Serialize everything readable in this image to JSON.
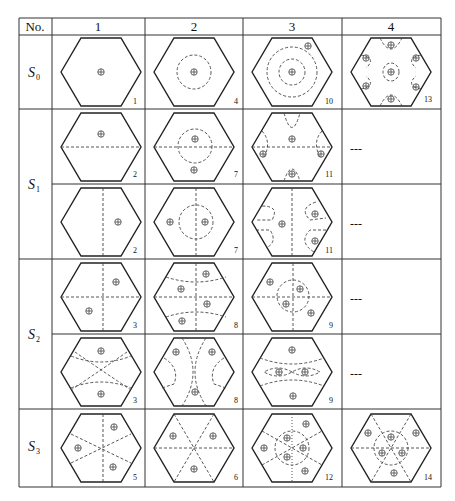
{
  "table": {
    "header": [
      "No.",
      "1",
      "2",
      "3",
      "4"
    ],
    "rows": [
      {
        "label": "S",
        "sub": "0",
        "cells": [
          {
            "num": "1",
            "desc": "single center plus"
          },
          {
            "num": "4",
            "desc": "center plus with dashed circle"
          },
          {
            "num": "10",
            "desc": "concentric dashed circles, center plus, corner plus"
          },
          {
            "num": "13",
            "desc": "center plus in small circle, six edge half-circles with plus"
          }
        ]
      },
      {
        "label": "S",
        "sub": "1",
        "cells": [
          {
            "num": "2",
            "desc": "horizontal dashed line, top plus"
          },
          {
            "num": "7",
            "desc": "horizontal line, dashed circle with plus, bottom plus"
          },
          {
            "num": "11",
            "desc": "horizontal line, arcs with plus"
          },
          {
            "num": "",
            "desc": "---"
          }
        ]
      },
      {
        "label": "",
        "sub": "",
        "cells": [
          {
            "num": "2",
            "desc": "vertical dashed line, right plus"
          },
          {
            "num": "7",
            "desc": "vertical line, dashed circle, two plus"
          },
          {
            "num": "11",
            "desc": "vertical line, arcs with plus"
          },
          {
            "num": "",
            "desc": "---"
          }
        ]
      },
      {
        "label": "S",
        "sub": "2",
        "cells": [
          {
            "num": "3",
            "desc": "cross lines, two plus"
          },
          {
            "num": "8",
            "desc": "cross lines with arcs, four plus"
          },
          {
            "num": "9",
            "desc": "cross lines, circle, four plus"
          },
          {
            "num": "",
            "desc": "---"
          }
        ]
      },
      {
        "label": "",
        "sub": "",
        "cells": [
          {
            "num": "3",
            "desc": "diagonal curves, two plus"
          },
          {
            "num": "8",
            "desc": "crossing arcs, three plus"
          },
          {
            "num": "9",
            "desc": "arcs, lemniscate, four plus"
          },
          {
            "num": "",
            "desc": "---"
          }
        ]
      },
      {
        "label": "S",
        "sub": "3",
        "cells": [
          {
            "num": "5",
            "desc": "three dashed lines, three plus"
          },
          {
            "num": "6",
            "desc": "six dashed spokes, three plus"
          },
          {
            "num": "12",
            "desc": "spokes, circle, six plus"
          },
          {
            "num": "14",
            "desc": "spokes, circle, six plus"
          }
        ]
      }
    ],
    "empty_marker": "---"
  }
}
